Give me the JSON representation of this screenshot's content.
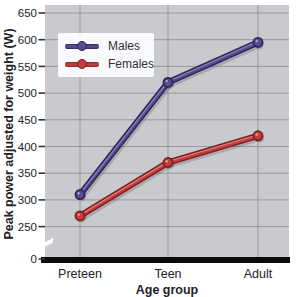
{
  "chart_data": {
    "type": "line",
    "title": "",
    "xlabel": "Age group",
    "ylabel": "Peak power adjusted for weight (W)",
    "categories": [
      "Preteen",
      "Teen",
      "Adult"
    ],
    "series": [
      {
        "name": "Males",
        "values": [
          310,
          520,
          595
        ],
        "color": "#564c8f",
        "edge": "#2c2456",
        "light": "#978dc2"
      },
      {
        "name": "Females",
        "values": [
          270,
          370,
          420
        ],
        "color": "#c23d3d",
        "edge": "#7e1f1f",
        "light": "#e39090"
      }
    ],
    "yticks": [
      650,
      600,
      550,
      500,
      450,
      400,
      350,
      300,
      250,
      0
    ],
    "axis_break_between": [
      0,
      250
    ],
    "grid": true,
    "legend_position": "top-left",
    "colors": {
      "plot_bg": "#c9cace",
      "grid": "#97979e",
      "text": "#222226",
      "axis": "#0b0b0b"
    }
  }
}
